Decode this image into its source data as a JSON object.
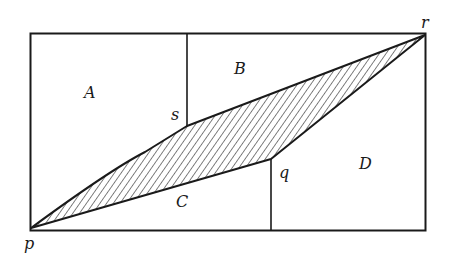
{
  "diagram": {
    "regions": {
      "A": "A",
      "B": "B",
      "C": "C",
      "D": "D"
    },
    "points": {
      "p": "p",
      "q": "q",
      "r": "r",
      "s": "s"
    },
    "shaded_region": "parallelogram p-s-r-q (hatched)",
    "colors": {
      "stroke": "#1a1a1a",
      "background": "#ffffff"
    }
  }
}
